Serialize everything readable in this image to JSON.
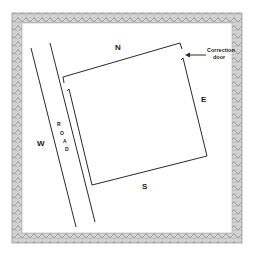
{
  "diagram": {
    "type": "site-plan",
    "colors": {
      "background": "#ffffff",
      "line": "#2a2a2a",
      "border_fill": "#c8c8c8",
      "border_dark": "#8a8a8a",
      "text": "#1a1a1a"
    },
    "directions": {
      "north": "N",
      "south": "S",
      "east": "E",
      "west": "W"
    },
    "road": {
      "letters": [
        "R",
        "O",
        "A",
        "D"
      ]
    },
    "annotation": {
      "line1": "Correction",
      "line2": "door",
      "arrow": "left-arrow-icon"
    }
  }
}
